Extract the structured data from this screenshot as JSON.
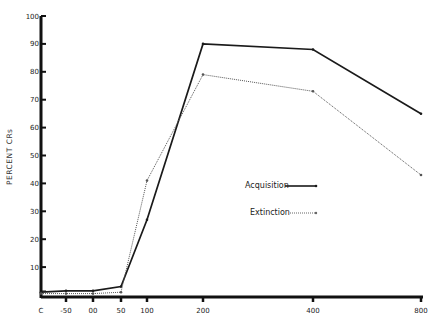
{
  "chart_data": {
    "type": "line",
    "title": "",
    "xlabel": "",
    "ylabel": "PERCENT CRs",
    "categories": [
      "C",
      "-50",
      "00",
      "50",
      "100",
      "200",
      "400",
      "800"
    ],
    "x_positions_px": [
      41,
      66,
      93,
      121,
      147,
      203,
      313,
      421
    ],
    "ylim": [
      0,
      100
    ],
    "yticks": [
      10,
      20,
      30,
      40,
      50,
      60,
      70,
      80,
      90,
      100
    ],
    "grid": false,
    "legend_position": "center-right",
    "series": [
      {
        "name": "Acquisition",
        "style": "solid",
        "color": "#1a1a1a",
        "values": [
          1,
          1.5,
          1.5,
          3,
          27,
          90,
          88,
          65
        ]
      },
      {
        "name": "Extinction",
        "style": "dotted",
        "color": "#555555",
        "values": [
          0.5,
          0.5,
          0.5,
          1,
          41,
          79,
          73,
          43
        ]
      }
    ]
  },
  "labels": {
    "ylabel": "PERCENT CRs",
    "legend_acquisition": "Acquisition",
    "legend_extinction": "Extinction"
  }
}
